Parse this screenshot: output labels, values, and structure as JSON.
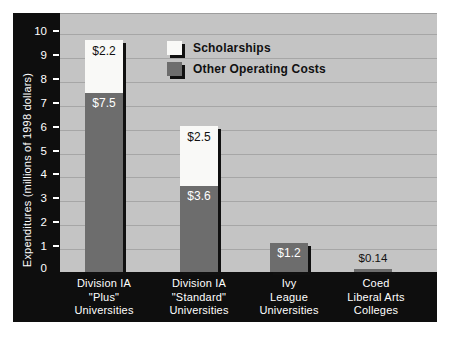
{
  "colors": {
    "page_background": "#ffffff",
    "frame": "#0e0e0e",
    "plot_background": "#c4c4c4",
    "gridline": "#a6a6a6",
    "bar_other": "#6d6d6d",
    "bar_scholarships": "#f9f9f7",
    "shadow": "#101010",
    "label_on_dark": "#ffffff",
    "label_on_light": "#111111"
  },
  "legend": {
    "items": [
      {
        "label": "Scholarships",
        "series_key": "scholarships"
      },
      {
        "label": "Other Operating Costs",
        "series_key": "other"
      }
    ]
  },
  "chart_data": {
    "type": "bar",
    "stacked": true,
    "title": "",
    "xlabel": "",
    "ylabel": "Expenditures (millions of 1998 dollars)",
    "ylim": [
      0,
      10.8
    ],
    "yticks": [
      0,
      1,
      2,
      3,
      4,
      5,
      6,
      7,
      8,
      9,
      10
    ],
    "grid": true,
    "legend_position": "top-center-inside",
    "categories": [
      [
        "Division IA",
        "\"Plus\"",
        "Universities"
      ],
      [
        "Division IA",
        "\"Standard\"",
        "Universities"
      ],
      [
        "Ivy",
        "League",
        "Universities"
      ],
      [
        "Coed",
        "Liberal Arts",
        "Colleges"
      ]
    ],
    "series": [
      {
        "name": "Scholarships",
        "key": "scholarships",
        "values": [
          2.2,
          2.5,
          0,
          0
        ],
        "data_labels": [
          "$2.2",
          "$2.5",
          "",
          ""
        ]
      },
      {
        "name": "Other Operating Costs",
        "key": "other",
        "values": [
          7.5,
          3.6,
          1.2,
          0.14
        ],
        "data_labels": [
          "$7.5",
          "$3.6",
          "$1.2",
          "$0.14"
        ]
      }
    ]
  }
}
